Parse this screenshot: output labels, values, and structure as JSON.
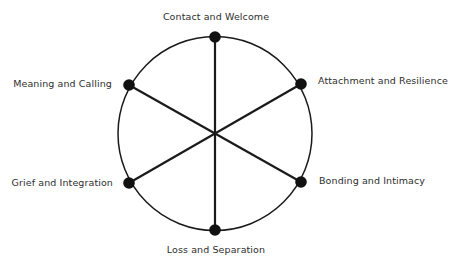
{
  "diagram": {
    "colors": {
      "stroke": "#1a1a1a",
      "node": "#111111",
      "text": "#2e2e2e",
      "background": "#ffffff"
    },
    "circle": {
      "cx": 215,
      "cy": 133.5,
      "r": 97
    },
    "nodes": [
      {
        "id": "top",
        "label": "Contact and Welcome",
        "x": 215,
        "y": 37
      },
      {
        "id": "upper-right",
        "label": "Attachment and Resilience",
        "x": 301,
        "y": 84
      },
      {
        "id": "lower-right",
        "label": "Bonding and Intimacy",
        "x": 301,
        "y": 182
      },
      {
        "id": "bottom",
        "label": "Loss and Separation",
        "x": 215,
        "y": 230
      },
      {
        "id": "lower-left",
        "label": "Grief and Integration",
        "x": 129,
        "y": 183
      },
      {
        "id": "upper-left",
        "label": "Meaning and Calling",
        "x": 129,
        "y": 85
      }
    ]
  }
}
